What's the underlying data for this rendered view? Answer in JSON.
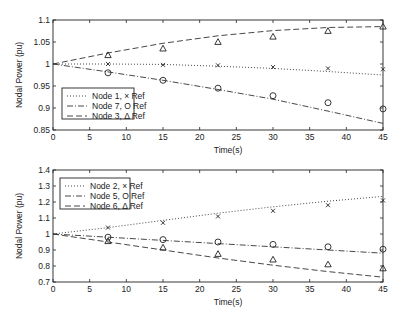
{
  "chart_data": [
    {
      "type": "line",
      "title": "",
      "xlabel": "Time(s)",
      "ylabel": "Nodal Power (pu)",
      "xlim": [
        0,
        45
      ],
      "ylim": [
        0.85,
        1.1
      ],
      "xticks": [
        0,
        5,
        10,
        15,
        20,
        25,
        30,
        35,
        40,
        45
      ],
      "yticks": [
        0.85,
        0.9,
        0.95,
        1,
        1.05,
        1.1
      ],
      "ytick_labels": [
        "0.85",
        "0.9",
        "0.95",
        "1",
        "1.05",
        "1.1"
      ],
      "grid": false,
      "legend_position": "lower left",
      "series": [
        {
          "name": "Node 1, × Ref",
          "style": "dotted",
          "marker": "x",
          "line_x": [
            0,
            7.5,
            15,
            22.5,
            30,
            37.5,
            45
          ],
          "line_y": [
            1.0,
            1.0,
            0.999,
            0.995,
            0.99,
            0.983,
            0.975
          ],
          "ref_x": [
            7.5,
            15,
            22.5,
            30,
            37.5,
            45
          ],
          "ref_y": [
            1.0,
            0.998,
            0.997,
            0.993,
            0.99,
            0.988
          ]
        },
        {
          "name": "Node 7, O Ref",
          "style": "dashdot",
          "marker": "o",
          "line_x": [
            0,
            7.5,
            15,
            22.5,
            30,
            37.5,
            45
          ],
          "line_y": [
            1.0,
            0.982,
            0.963,
            0.942,
            0.92,
            0.893,
            0.865
          ],
          "ref_x": [
            7.5,
            15,
            22.5,
            30,
            37.5,
            45
          ],
          "ref_y": [
            0.98,
            0.963,
            0.945,
            0.928,
            0.912,
            0.898
          ]
        },
        {
          "name": "Node 3, Δ Ref",
          "style": "dashed",
          "marker": "triangle",
          "line_x": [
            0,
            7.5,
            15,
            22.5,
            30,
            37.5,
            45
          ],
          "line_y": [
            1.0,
            1.025,
            1.047,
            1.064,
            1.076,
            1.083,
            1.085
          ],
          "ref_x": [
            7.5,
            15,
            22.5,
            30,
            37.5,
            45
          ],
          "ref_y": [
            1.02,
            1.035,
            1.05,
            1.062,
            1.075,
            1.085
          ]
        }
      ]
    },
    {
      "type": "line",
      "title": "",
      "xlabel": "Time(s)",
      "ylabel": "Nodal Power (pu)",
      "xlim": [
        0,
        45
      ],
      "ylim": [
        0.7,
        1.4
      ],
      "xticks": [
        0,
        5,
        10,
        15,
        20,
        25,
        30,
        35,
        40,
        45
      ],
      "yticks": [
        0.7,
        0.8,
        0.9,
        1,
        1.1,
        1.2,
        1.3,
        1.4
      ],
      "ytick_labels": [
        "0.7",
        "0.8",
        "0.9",
        "1",
        "1.1",
        "1.2",
        "1.3",
        "1.4"
      ],
      "grid": false,
      "legend_position": "upper left",
      "series": [
        {
          "name": "Node 2, × Ref",
          "style": "dotted",
          "marker": "x",
          "line_x": [
            0,
            7.5,
            15,
            22.5,
            30,
            37.5,
            45
          ],
          "line_y": [
            1.0,
            1.04,
            1.085,
            1.13,
            1.17,
            1.205,
            1.235
          ],
          "ref_x": [
            7.5,
            15,
            22.5,
            30,
            37.5,
            45
          ],
          "ref_y": [
            1.04,
            1.07,
            1.11,
            1.145,
            1.18,
            1.21
          ]
        },
        {
          "name": "Node 5, O Ref",
          "style": "dashdot",
          "marker": "o",
          "line_x": [
            0,
            7.5,
            15,
            22.5,
            30,
            37.5,
            45
          ],
          "line_y": [
            1.0,
            0.98,
            0.96,
            0.94,
            0.92,
            0.9,
            0.88
          ],
          "ref_x": [
            7.5,
            15,
            22.5,
            30,
            37.5,
            45
          ],
          "ref_y": [
            0.98,
            0.965,
            0.95,
            0.935,
            0.92,
            0.905
          ]
        },
        {
          "name": "Node 6, Δ Ref",
          "style": "dashed",
          "marker": "triangle",
          "line_x": [
            0,
            7.5,
            15,
            22.5,
            30,
            37.5,
            45
          ],
          "line_y": [
            1.0,
            0.95,
            0.9,
            0.85,
            0.805,
            0.765,
            0.73
          ],
          "ref_x": [
            7.5,
            15,
            22.5,
            30,
            37.5,
            45
          ],
          "ref_y": [
            0.955,
            0.915,
            0.875,
            0.84,
            0.81,
            0.785
          ]
        }
      ]
    }
  ],
  "charts": {
    "top": {
      "ylabel": "Nodal Power (pu)",
      "xlabel": "Time(s)",
      "legend": [
        "Node 1, × Ref",
        "Node 7, O Ref",
        "Node 3, Δ Ref"
      ]
    },
    "bottom": {
      "ylabel": "Nodal Power (pu)",
      "xlabel": "Time(s)",
      "legend": [
        "Node 2, × Ref",
        "Node 5, O Ref",
        "Node 6, Δ Ref"
      ]
    }
  }
}
